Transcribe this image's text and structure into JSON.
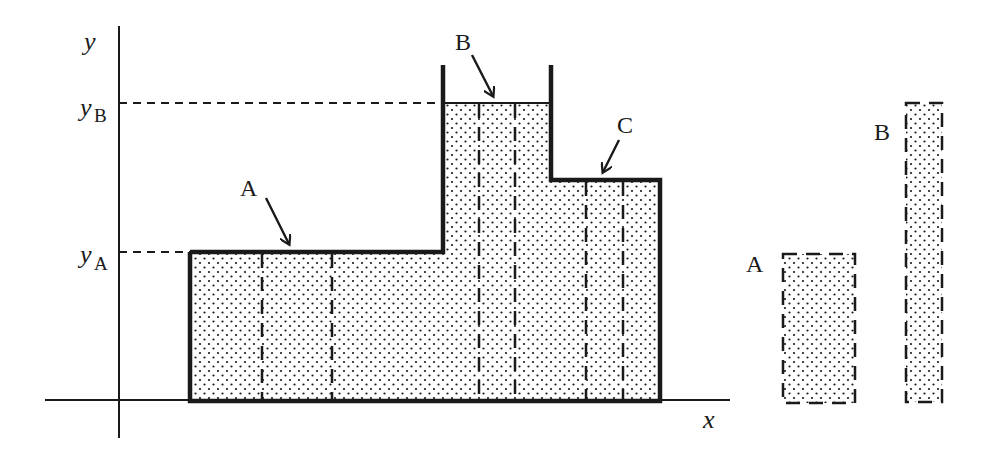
{
  "diagram": {
    "type": "fluid-column-pressure-diagram",
    "colors": {
      "stroke": "#1a1a1a",
      "fill_dots": "#1a1a1a",
      "background": "#ffffff"
    },
    "axes": {
      "x_label": "x",
      "y_label": "y",
      "y_levels": [
        {
          "label_main": "y",
          "label_sub": "B"
        },
        {
          "label_main": "y",
          "label_sub": "A"
        }
      ]
    },
    "container_labels": {
      "A": "A",
      "B": "B",
      "C": "C"
    },
    "isolated_columns": [
      {
        "label": "A"
      },
      {
        "label": "B"
      }
    ]
  }
}
